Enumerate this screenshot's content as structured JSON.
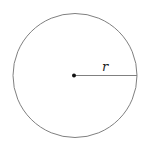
{
  "diagram": {
    "circle": {
      "cx": 75,
      "cy": 75.5,
      "r": 62,
      "stroke": "#808080"
    },
    "center_point": {
      "x": 74,
      "y": 75.5,
      "color": "#111111"
    },
    "radius_line": {
      "x1": 74,
      "y1": 75.5,
      "x2": 137,
      "y2": 75.5,
      "stroke": "#808080"
    },
    "radius_label": "r"
  }
}
